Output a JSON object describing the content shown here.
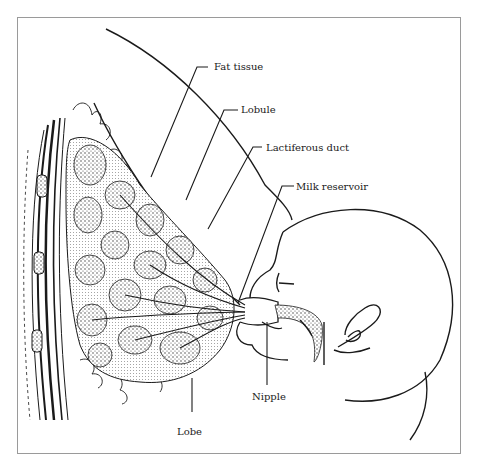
{
  "figure": {
    "labels": {
      "fat_tissue": "Fat tissue",
      "lobule": "Lobule",
      "lactiferous_duct": "Lactiferous duct",
      "milk_reservoir": "Milk reservoir",
      "nipple": "Nipple",
      "lobe": "Lobe"
    },
    "colors": {
      "ink": "#1a1a1a",
      "frame": "#9a9a9a",
      "background": "#ffffff"
    }
  }
}
